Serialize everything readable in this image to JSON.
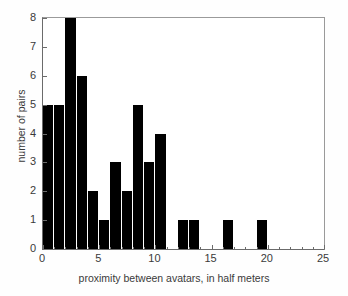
{
  "chart_data": {
    "type": "bar",
    "title": "",
    "subtitle": "",
    "xlabel": "proximity between avatars, in half meters",
    "ylabel": "number of pairs",
    "xlim": [
      0,
      25
    ],
    "ylim": [
      0,
      8
    ],
    "grid": false,
    "legend": null,
    "bar_color": "#000000",
    "bin_width": 1,
    "x_tick_labels": [
      "0",
      "5",
      "10",
      "15",
      "20",
      "25"
    ],
    "x_tick_values": [
      0,
      5,
      10,
      15,
      20,
      25
    ],
    "x_minor_ticks": [
      1,
      2,
      3,
      4,
      6,
      7,
      8,
      9,
      11,
      12,
      13,
      14,
      16,
      17,
      18,
      19,
      21,
      22,
      23,
      24
    ],
    "y_tick_labels": [
      "0",
      "1",
      "2",
      "3",
      "4",
      "5",
      "6",
      "7",
      "8"
    ],
    "y_tick_values": [
      0,
      1,
      2,
      3,
      4,
      5,
      6,
      7,
      8
    ],
    "categories": [
      1,
      2,
      3,
      4,
      5,
      6,
      7,
      8,
      9,
      10,
      11,
      12,
      13,
      14,
      15,
      16,
      17,
      18,
      19,
      20
    ],
    "values": [
      5,
      5,
      8,
      6,
      2,
      1,
      3,
      2,
      5,
      3,
      4,
      0,
      1,
      1,
      0,
      0,
      1,
      0,
      0,
      1
    ],
    "bars": [
      {
        "x": 1,
        "value": 5
      },
      {
        "x": 2,
        "value": 5
      },
      {
        "x": 3,
        "value": 8
      },
      {
        "x": 4,
        "value": 6
      },
      {
        "x": 5,
        "value": 2
      },
      {
        "x": 6,
        "value": 1
      },
      {
        "x": 7,
        "value": 3
      },
      {
        "x": 8,
        "value": 2
      },
      {
        "x": 9,
        "value": 5
      },
      {
        "x": 10,
        "value": 3
      },
      {
        "x": 11,
        "value": 4
      },
      {
        "x": 12,
        "value": 0
      },
      {
        "x": 13,
        "value": 1
      },
      {
        "x": 14,
        "value": 1
      },
      {
        "x": 15,
        "value": 0
      },
      {
        "x": 16,
        "value": 0
      },
      {
        "x": 17,
        "value": 1
      },
      {
        "x": 18,
        "value": 0
      },
      {
        "x": 19,
        "value": 0
      },
      {
        "x": 20,
        "value": 1
      }
    ]
  }
}
